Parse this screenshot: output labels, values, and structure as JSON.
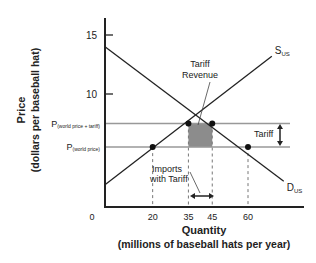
{
  "chart_data": {
    "type": "line",
    "title": "",
    "xlabel": "Quantity",
    "xlabel_sub": "(millions of baseball hats per year)",
    "ylabel": "Price",
    "ylabel_sub": "(dollars per baseball hat)",
    "xlim": [
      0,
      90
    ],
    "ylim": [
      0,
      16
    ],
    "x_ticks": [
      0,
      20,
      35,
      45,
      60
    ],
    "x_tick_labels": [
      "0",
      "20",
      "35",
      "45",
      "60"
    ],
    "y_ticks": [
      10,
      15
    ],
    "y_tick_labels": [
      "10",
      "15"
    ],
    "grid": false,
    "series": [
      {
        "name": "S",
        "sub": "US",
        "points": [
          [
            0,
            2.3
          ],
          [
            70,
            13.2
          ]
        ]
      },
      {
        "name": "D",
        "sub": "US",
        "points": [
          [
            0,
            14.0
          ],
          [
            75,
            2.6
          ]
        ]
      }
    ],
    "price_lines": [
      {
        "label": "P",
        "sub": "(world price + tariff)",
        "value": 7.5
      },
      {
        "label": "P",
        "sub": "(world price)",
        "value": 5.5
      }
    ],
    "points": [
      {
        "x": 20,
        "y": 5.5
      },
      {
        "x": 35,
        "y": 7.5
      },
      {
        "x": 45,
        "y": 7.5
      },
      {
        "x": 60,
        "y": 5.5
      }
    ],
    "shaded_region": {
      "x": [
        35,
        45
      ],
      "y": [
        5.5,
        7.5
      ],
      "label": "Tariff Revenue"
    },
    "annotations": {
      "tariff_revenue": [
        "Tariff",
        "Revenue"
      ],
      "imports": [
        "Imports",
        "with Tariff"
      ],
      "tariff": "Tariff"
    },
    "colors": {
      "line": "#222222",
      "price_line": "#999999",
      "shade": "#8c8c8c"
    }
  }
}
